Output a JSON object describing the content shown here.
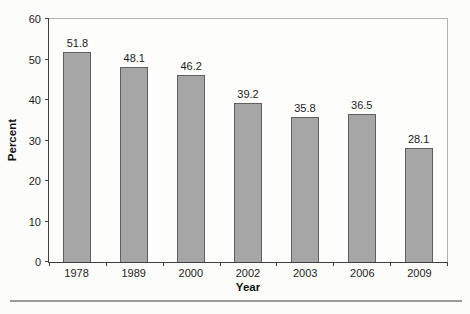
{
  "chart_data": {
    "type": "bar",
    "title": "",
    "categories": [
      "1978",
      "1989",
      "2000",
      "2002",
      "2003",
      "2006",
      "2009"
    ],
    "values": [
      51.8,
      48.1,
      46.2,
      39.2,
      35.8,
      36.5,
      28.1
    ],
    "value_labels": [
      "51.8",
      "48.1",
      "46.2",
      "39.2",
      "35.8",
      "36.5",
      "28.1"
    ],
    "xlabel": "Year",
    "ylabel": "Percent",
    "ylim": [
      0,
      60
    ],
    "yticks": [
      0,
      10,
      20,
      30,
      40,
      50,
      60
    ],
    "grid": "off",
    "legend": "none",
    "bar_fill": "#a6a6a6",
    "bar_border": "#5f5f5f",
    "axis_color": "#3f3f3f"
  }
}
